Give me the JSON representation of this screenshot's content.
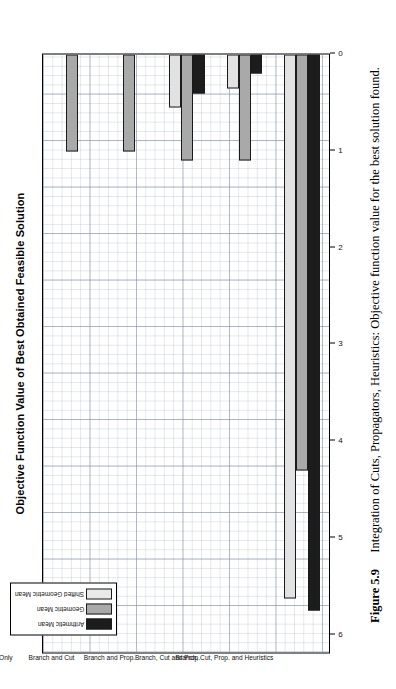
{
  "figure": {
    "number_label": "Figure 5.9",
    "caption": "Integration of Cuts, Propagators, Heuristics: Objective function value for the best solution found."
  },
  "legend": {
    "position": "top-left",
    "items": [
      {
        "label": "Arithmetic Mean",
        "color": "#1c1c1c"
      },
      {
        "label": "Geometric Mean",
        "color": "#a9a9a9"
      },
      {
        "label": "Shifted Geometric Mean",
        "color": "#e9e9e9"
      }
    ]
  },
  "axis": {
    "value_ticks": [
      "0",
      "1",
      "2",
      "3",
      "4",
      "5",
      "6"
    ]
  },
  "chart_data": {
    "type": "bar",
    "orientation": "horizontal",
    "title": "Objective Function Value of Best Obtained Feasible Solution",
    "xlabel": "",
    "ylabel": "",
    "xlim": [
      0,
      6.2
    ],
    "grid": true,
    "legend_position": "top-left",
    "categories": [
      "Branch Only",
      "Branch and Cut",
      "Branch and Prop.",
      "Branch, Cut and Prop.",
      "Branch, Cut, Prop. and Heuristics"
    ],
    "series": [
      {
        "name": "Arithmetic Mean",
        "color": "#1c1c1c",
        "values": [
          0.0,
          0.0,
          0.4,
          0.2,
          5.75
        ]
      },
      {
        "name": "Geometric Mean",
        "color": "#a9a9a9",
        "values": [
          1.0,
          1.0,
          1.1,
          1.1,
          4.3
        ]
      },
      {
        "name": "Shifted Geometric Mean",
        "color": "#e9e9e9",
        "values": [
          0.0,
          0.0,
          0.55,
          0.35,
          5.62
        ]
      }
    ]
  }
}
